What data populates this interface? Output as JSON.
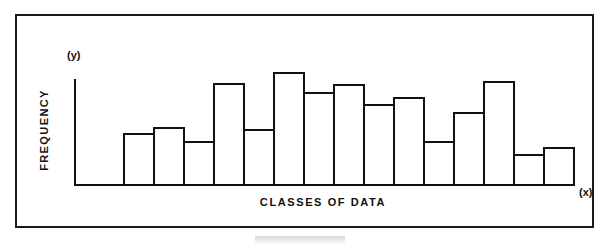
{
  "figure": {
    "background_color": "#ffffff",
    "ink_color": "#111111",
    "frame_color": "#1a1a1a"
  },
  "axes": {
    "y_marker": "(y)",
    "x_marker": "(x)",
    "y_title": "FREQUENCY",
    "x_title": "CLASSES OF DATA"
  },
  "chart_data": {
    "type": "bar",
    "title": "",
    "subtitle": "",
    "xlabel": "CLASSES OF DATA",
    "ylabel": "FREQUENCY",
    "grid": false,
    "legend": "none",
    "axis_end_labels": {
      "x": "(x)",
      "y": "(y)"
    },
    "tick_labels": {
      "x": [],
      "y": []
    },
    "xlim": [
      0,
      15
    ],
    "ylim": [
      0,
      12
    ],
    "bar_gap": 0,
    "categories": [
      "1",
      "2",
      "3",
      "4",
      "5",
      "6",
      "7",
      "8",
      "9",
      "10",
      "11",
      "12",
      "13",
      "14",
      "15"
    ],
    "values": [
      4.6,
      5.2,
      3.9,
      9.0,
      5.0,
      10.0,
      8.2,
      8.9,
      7.2,
      7.8,
      3.9,
      6.5,
      9.2,
      2.8,
      3.4
    ]
  }
}
